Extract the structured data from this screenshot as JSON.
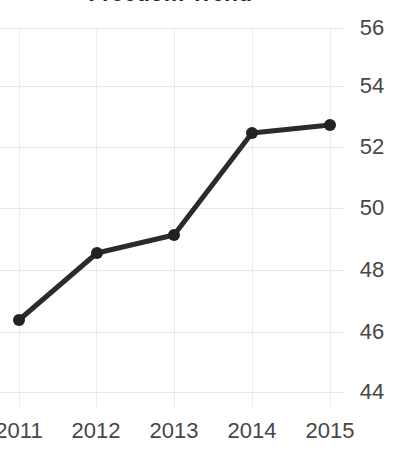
{
  "chart_data": {
    "type": "line",
    "title": "Freedom Trend",
    "xlabel": "",
    "ylabel": "",
    "categories": [
      "2011",
      "2012",
      "2013",
      "2014",
      "2015"
    ],
    "x": [
      2011,
      2012,
      2013,
      2014,
      2015
    ],
    "values": [
      46.4,
      48.6,
      49.2,
      52.4,
      52.7
    ],
    "series": [
      {
        "name": "Freedom Trend",
        "values": [
          46.4,
          48.6,
          49.2,
          52.4,
          52.7
        ]
      }
    ],
    "ylim": [
      43.2,
      56.5
    ],
    "yticks": [
      56,
      54,
      52,
      50,
      48,
      46,
      44
    ],
    "ytick_labels": [
      "56",
      "54",
      "52",
      "50",
      "48",
      "46",
      "44"
    ],
    "xtick_labels": [
      "2011",
      "2012",
      "2013",
      "2014",
      "2015"
    ],
    "grid": true,
    "y_axis_position": "right",
    "legend": false,
    "legend_position": "none",
    "colors": {
      "line": "#2b2b2b",
      "marker": "#222222",
      "grid": "#e8e8e8",
      "tick_text": "#474747",
      "title_text": "#262626",
      "background": "#ffffff"
    },
    "line_width": 5,
    "marker_size": 7
  },
  "axes": {
    "y_ticks": [
      {
        "label": "56",
        "value": 56,
        "y": 28
      },
      {
        "label": "54",
        "value": 54,
        "y": 86
      },
      {
        "label": "52",
        "value": 52,
        "y": 147
      },
      {
        "label": "50",
        "value": 50,
        "y": 208
      },
      {
        "label": "48",
        "value": 48,
        "y": 270
      },
      {
        "label": "46",
        "value": 46,
        "y": 332
      },
      {
        "label": "44",
        "value": 44,
        "y": 392
      }
    ],
    "x_ticks": [
      {
        "label": "2011",
        "x": 19
      },
      {
        "label": "2012",
        "x": 96
      },
      {
        "label": "2013",
        "x": 174
      },
      {
        "label": "2014",
        "x": 252
      },
      {
        "label": "2015",
        "x": 330
      }
    ]
  },
  "points": [
    {
      "label": "2011",
      "value": "46.4",
      "x": 19,
      "y": 320
    },
    {
      "label": "2012",
      "value": "48.6",
      "x": 97,
      "y": 253
    },
    {
      "label": "2013",
      "value": "49.2",
      "x": 174,
      "y": 235
    },
    {
      "label": "2014",
      "value": "52.4",
      "x": 252,
      "y": 133
    },
    {
      "label": "2015",
      "value": "52.7",
      "x": 330,
      "y": 125
    }
  ]
}
